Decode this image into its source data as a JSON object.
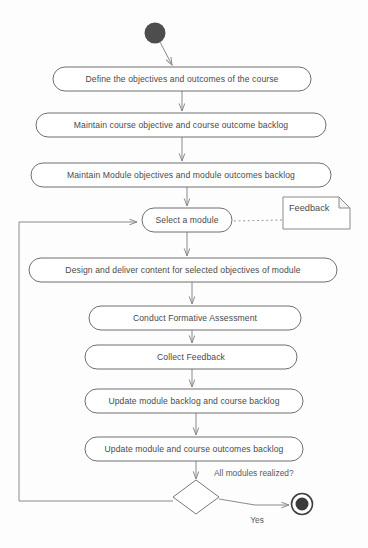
{
  "diagram": {
    "type": "uml-activity-diagram",
    "canvas": {
      "width": 368,
      "height": 548
    },
    "colors": {
      "background": "#fdfdfd",
      "node_stroke": "#6f6f6f",
      "node_fill": "#ffffff",
      "edge_stroke": "#8a8a8a",
      "text": "#4a4a4a",
      "start_node": "#4d4d4d",
      "end_node": "#3a3a3a"
    },
    "start_node": {
      "label": "start",
      "cx": 155,
      "cy": 33,
      "r": 10.5
    },
    "end_node": {
      "label": "end",
      "cx": 302,
      "cy": 504,
      "outer_r": 10.5,
      "inner_r": 6.5
    },
    "activities": [
      {
        "id": "define-objectives",
        "label": "Define the objectives and outcomes of the course",
        "x": 53,
        "y": 67,
        "width": 258,
        "height": 24
      },
      {
        "id": "maintain-course-backlog",
        "label": "Maintain course objective and course outcome backlog",
        "x": 36,
        "y": 113,
        "width": 290,
        "height": 24
      },
      {
        "id": "maintain-module-backlog",
        "label": "Maintain Module objectives and module outcomes backlog",
        "x": 31,
        "y": 163,
        "width": 300,
        "height": 24
      },
      {
        "id": "select-a-module",
        "label": "Select a module",
        "x": 142,
        "y": 208,
        "width": 90,
        "height": 24
      },
      {
        "id": "design-deliver-content",
        "label": "Design and deliver content for selected objectives of module",
        "x": 29,
        "y": 258,
        "width": 308,
        "height": 24
      },
      {
        "id": "conduct-formative-assessment",
        "label": "Conduct Formative Assessment",
        "x": 89,
        "y": 306,
        "width": 212,
        "height": 24
      },
      {
        "id": "collect-feedback",
        "label": "Collect Feedback",
        "x": 85,
        "y": 345,
        "width": 212,
        "height": 24
      },
      {
        "id": "update-module-course-backlog",
        "label": "Update module backlog and course backlog",
        "x": 85,
        "y": 389,
        "width": 218,
        "height": 24
      },
      {
        "id": "update-outcomes-backlog",
        "label": "Update module and course outcomes backlog",
        "x": 85,
        "y": 437,
        "width": 218,
        "height": 24
      }
    ],
    "decision": {
      "id": "all-modules-realized",
      "label": "All modules realized?",
      "cx": 196,
      "cy": 497,
      "half_width": 23,
      "half_height": 17,
      "label_x": 214,
      "label_y": 474
    },
    "note": {
      "id": "feedback-note",
      "label": "Feedback",
      "x": 283,
      "y": 197,
      "width": 67,
      "height": 32,
      "fold": 11
    },
    "edges": [
      {
        "id": "start-to-define",
        "label": ""
      },
      {
        "id": "define-to-maintain-course",
        "label": ""
      },
      {
        "id": "maintain-course-to-maintain-module",
        "label": ""
      },
      {
        "id": "maintain-module-to-select",
        "label": ""
      },
      {
        "id": "select-to-design",
        "label": ""
      },
      {
        "id": "design-to-conduct",
        "label": ""
      },
      {
        "id": "conduct-to-collect",
        "label": ""
      },
      {
        "id": "collect-to-update-backlog",
        "label": ""
      },
      {
        "id": "update-backlog-to-update-outcomes",
        "label": ""
      },
      {
        "id": "update-outcomes-to-decision",
        "label": ""
      },
      {
        "id": "decision-to-end",
        "label": "Yes"
      },
      {
        "id": "decision-loop-back-to-select",
        "label": ""
      },
      {
        "id": "select-to-feedback-note",
        "label": ""
      }
    ]
  }
}
